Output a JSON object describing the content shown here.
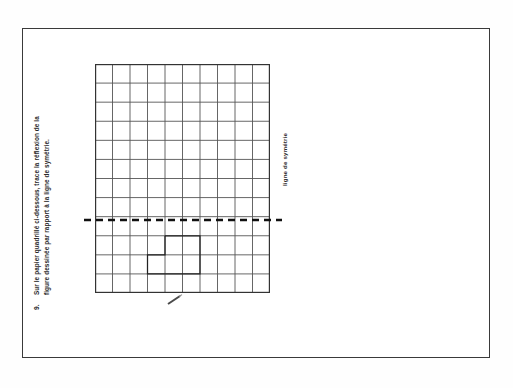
{
  "page": {
    "background_color": "#ffffff",
    "border_color": "#3a3a3a"
  },
  "question": {
    "number": "9.",
    "line1": "Sur le papier quadrillé ci-dessous, trace la réflexion de la",
    "line2": "figure dessinée par rapport à la ligne de symétrie.",
    "full_text": "Sur le papier quadrillé ci-dessous, trace la réflexion de la figure dessinée par rapport à la ligne de symétrie.",
    "orientation": "rotated-90-ccw"
  },
  "symmetry_line": {
    "label": "ligne de symétrie",
    "style": "dashed",
    "orientation": "horizontal",
    "color": "#111111",
    "grid_row_from_top": 8
  },
  "grid": {
    "columns": 10,
    "rows": 12,
    "line_color": "#555555",
    "border_color": "#333333",
    "cell_width": 17.5,
    "cell_height": 19.1
  },
  "figure": {
    "name": "l-shaped-polygon",
    "stroke_color": "#222222",
    "vertices_in_cells": [
      [
        4,
        9
      ],
      [
        6,
        9
      ],
      [
        6,
        11
      ],
      [
        3,
        11
      ],
      [
        3,
        10
      ],
      [
        4,
        10
      ]
    ]
  },
  "marks": {
    "pencil_mark": "stray-pencil-stroke"
  }
}
